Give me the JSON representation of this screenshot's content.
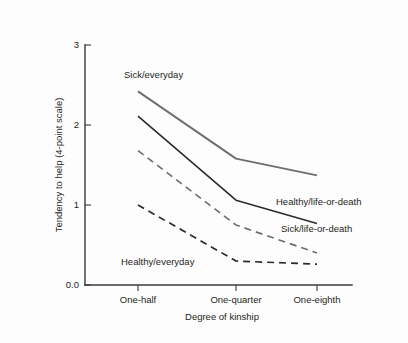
{
  "chart_data": {
    "type": "line",
    "title": "",
    "subtitle": "",
    "xlabel": "Degree of kinship",
    "ylabel": "Tendency to help (4-point scale)",
    "categories": [
      "One-half",
      "One-quarter",
      "One-eighth"
    ],
    "xtick_labels": [
      "One-half",
      "One-quarter",
      "One-eighth"
    ],
    "ytick_labels": [
      "0.0",
      "1",
      "2",
      "3"
    ],
    "ytick_values": [
      0,
      1,
      2,
      3
    ],
    "ylim": [
      0,
      3
    ],
    "grid": false,
    "legend_position": "inline-annotations",
    "series": [
      {
        "name": "Sick/everyday",
        "values": [
          2.42,
          1.58,
          1.37
        ],
        "style": "solid",
        "color": "#6e6e6e",
        "width": 1.9,
        "label_x": 124,
        "label_y": 78
      },
      {
        "name": "Healthy/life-or-death",
        "values": [
          2.11,
          1.06,
          0.77
        ],
        "style": "solid",
        "color": "#2b2b2b",
        "width": 1.6,
        "label_x": 276,
        "label_y": 205
      },
      {
        "name": "Sick/life-or-death",
        "values": [
          1.68,
          0.75,
          0.4
        ],
        "style": "dashed",
        "color": "#6e6e6e",
        "width": 1.7,
        "label_x": 281,
        "label_y": 232
      },
      {
        "name": "Healthy/everyday",
        "values": [
          1.0,
          0.3,
          0.26
        ],
        "style": "dashed",
        "color": "#2b2b2b",
        "width": 1.7,
        "label_x": 121,
        "label_y": 265
      }
    ],
    "annotations": [
      "Sick/everyday",
      "Healthy/life-or-death",
      "Sick/life-or-death",
      "Healthy/everyday"
    ]
  },
  "geometry": {
    "x_positions": [
      138,
      236,
      317
    ],
    "y_zero": 285,
    "y_top": 45,
    "px_per_unit": 80,
    "axis_x": 85,
    "axis_right": 352
  },
  "colors": {
    "axis": "#3a3a3a",
    "text": "#231f20",
    "series_gray": "#6e6e6e",
    "series_dark": "#2b2b2b",
    "background": "#fdfdfd"
  }
}
